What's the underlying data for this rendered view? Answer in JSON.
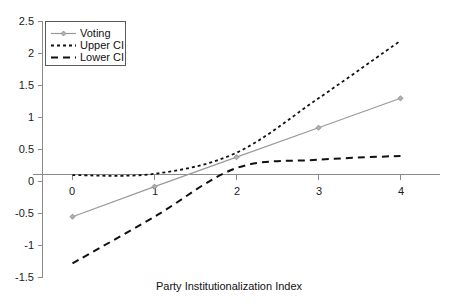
{
  "chart_data": {
    "type": "line",
    "title": "",
    "subtitle": "",
    "xlabel": "Party Institutionalization Index",
    "ylabel": "",
    "xlim": [
      -0.2,
      4.3
    ],
    "ylim": [
      -1.5,
      2.5
    ],
    "x_ticks": [
      0,
      1,
      2,
      3,
      4
    ],
    "x_tick_labels": [
      "0",
      "1",
      "2",
      "3",
      "4"
    ],
    "y_ticks": [
      -1.5,
      -1,
      -0.5,
      0,
      0.5,
      1,
      1.5,
      2,
      2.5
    ],
    "y_tick_labels": [
      "-1.5",
      "-1",
      "-0.5",
      "0",
      "0.5",
      "1",
      "1.5",
      "2",
      "2.5"
    ],
    "grid": false,
    "legend_position": "top-left",
    "x": [
      0,
      1,
      2,
      3,
      4
    ],
    "series": [
      {
        "name": "Voting",
        "style": "solid-with-markers",
        "color": "#999999",
        "values": [
          -0.55,
          -0.08,
          0.38,
          0.84,
          1.3
        ]
      },
      {
        "name": "Upper CI",
        "style": "dotted",
        "color": "#111111",
        "values": [
          0.1,
          0.12,
          0.45,
          1.3,
          2.2
        ]
      },
      {
        "name": "Lower CI",
        "style": "dashed",
        "color": "#111111",
        "values": [
          -1.28,
          -0.55,
          0.21,
          0.34,
          0.4
        ]
      }
    ],
    "annotations": []
  },
  "legend": {
    "items": [
      {
        "label": "Voting"
      },
      {
        "label": "Upper CI"
      },
      {
        "label": "Lower CI"
      }
    ]
  },
  "axis": {
    "x_title": "Party Institutionalization Index"
  }
}
